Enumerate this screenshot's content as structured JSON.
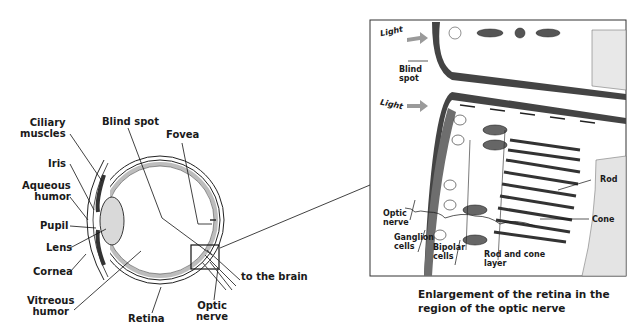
{
  "eye_diagram": {
    "labels": {
      "ciliary_muscles": "Ciliary\nmuscles",
      "blind_spot": "Blind spot",
      "fovea": "Fovea",
      "iris": "Iris",
      "aqueous_humor": "Aqueous\nhumor",
      "pupil": "Pupil",
      "lens": "Lens",
      "cornea": "Cornea",
      "vitreous_humor": "Vitreous\nhumor",
      "retina": "Retina",
      "optic_nerve": "Optic\nnerve",
      "to_the_brain": "to the brain"
    }
  },
  "enlargement_panel": {
    "labels": {
      "light_top": "Light",
      "light_bottom": "Light",
      "blind_spot": "Blind\nspot",
      "optic_nerve": "Optic\nnerve",
      "ganglion_cells": "Ganglion\ncells",
      "bipolar_cells": "Bipolar\ncells",
      "rod_and_cone_layer": "Rod and cone\nlayer",
      "rod": "Rod",
      "cone": "Cone"
    },
    "caption": "Enlargement of the retina in the\nregion of the optic nerve"
  },
  "colors": {
    "ink": "#1a1a1a",
    "lens_fill": "#d9d9d9",
    "retina_fill": "#bdbdbd",
    "nerve_fill": "#6e6e6e",
    "arrow_gray": "#9a9a9a"
  }
}
